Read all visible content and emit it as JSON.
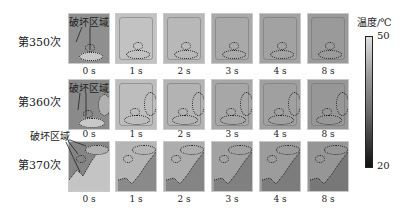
{
  "rows": [
    {
      "label": "第350次",
      "damage_label": "破坏区域"
    },
    {
      "label": "第360次",
      "damage_label": "破坏区域"
    },
    {
      "label": "第370次",
      "damage_label": "破坏区域"
    }
  ],
  "time_labels": [
    "0 s",
    "1 s",
    "2 s",
    "3 s",
    "4 s",
    "8 s"
  ],
  "colorbar": {
    "title": "温度/℃",
    "max_label": "50",
    "min_label": "20",
    "gradient_top": "#e0e0e0",
    "gradient_bottom": "#111111"
  },
  "panel_colors": {
    "row1": [
      "#8f8f8f",
      "#c2c2c2",
      "#b8b8b8",
      "#a9a9a9",
      "#a2a2a2",
      "#9a9a9a"
    ],
    "row2": [
      "#8a8a8a",
      "#bdbdbd",
      "#b3b3b3",
      "#a7a7a7",
      "#a0a0a0",
      "#979797"
    ],
    "row3": [
      "#858585",
      "#b5b5b5",
      "#adadad",
      "#a2a2a2",
      "#9c9c9c",
      "#969696"
    ]
  }
}
